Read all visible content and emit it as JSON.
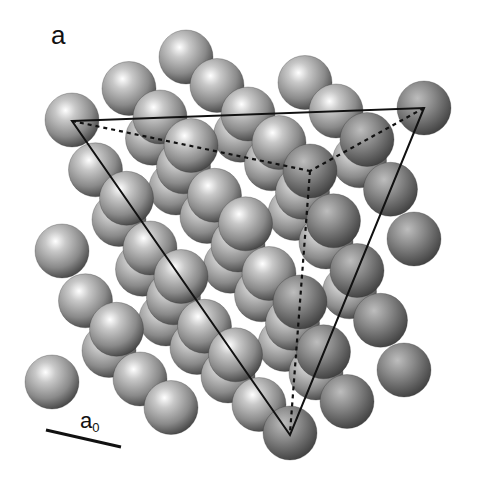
{
  "figure": {
    "panel_label": "a",
    "scale_bar": {
      "label_main": "a",
      "label_sub": "0",
      "x1": 46,
      "y1": 430,
      "x2": 121,
      "y2": 447
    },
    "lattice": {
      "type": "fcc",
      "origin_front_top": [
        310,
        171
      ],
      "vec_x": [
        114,
        -63
      ],
      "vec_y": [
        -238,
        -51
      ],
      "vec_z": [
        -20,
        262
      ],
      "cells": 2,
      "sphere_radius": 27,
      "colors": {
        "highlight": "#ffffff",
        "mid": "#9a9a9a",
        "dark": "#3a3a3a",
        "rim": "#2a2a2a"
      }
    },
    "plane_triangle": {
      "vertices": [
        [
          72,
          121
        ],
        [
          424,
          108
        ],
        [
          290,
          435
        ]
      ],
      "stroke": "#111111"
    },
    "hidden_edges": [
      {
        "from": [
          72,
          121
        ],
        "to": [
          310,
          171
        ]
      },
      {
        "from": [
          424,
          108
        ],
        "to": [
          310,
          171
        ]
      },
      {
        "from": [
          310,
          171
        ],
        "to": [
          290,
          433
        ]
      }
    ]
  }
}
